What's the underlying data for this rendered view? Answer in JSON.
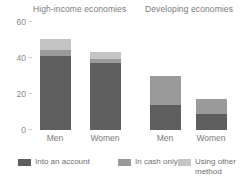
{
  "chart_data": {
    "type": "bar",
    "subtype": "stacked",
    "title": "",
    "xlabel": "",
    "ylabel": "",
    "ylim": [
      0,
      60
    ],
    "yticks": [
      0,
      20,
      40,
      60
    ],
    "grid": false,
    "legend_position": "bottom",
    "panels": [
      {
        "name": "High-income economies",
        "categories": [
          "Men",
          "Women"
        ]
      },
      {
        "name": "Developing economies",
        "categories": [
          "Men",
          "Women"
        ]
      }
    ],
    "categories": [
      "Men",
      "Women",
      "Men",
      "Women"
    ],
    "series": [
      {
        "name": "Into an account",
        "color": "#5e5e5e",
        "values": [
          41,
          37,
          14,
          9
        ]
      },
      {
        "name": "In cash only",
        "color": "#9a9a9a",
        "values": [
          3,
          2,
          16,
          8
        ]
      },
      {
        "name": "Using other method",
        "color": "#c4c4c4",
        "values": [
          6,
          4,
          0,
          0
        ]
      }
    ],
    "totals": [
      50,
      43,
      30,
      17
    ]
  },
  "titles": {
    "high_income": "High-income economies",
    "developing": "Developing economies"
  },
  "yaxis": {
    "ticks": [
      {
        "label": "60",
        "value": 60
      },
      {
        "label": "40",
        "value": 40
      },
      {
        "label": "20",
        "value": 20
      },
      {
        "label": "0",
        "value": 0
      }
    ]
  },
  "xaxis": {
    "ticks": [
      {
        "label": "Men"
      },
      {
        "label": "Women"
      },
      {
        "label": "Men"
      },
      {
        "label": "Women"
      }
    ]
  },
  "legend": {
    "items": [
      {
        "label": "Into an account",
        "color": "#5e5e5e"
      },
      {
        "label": "In cash only",
        "color": "#9a9a9a"
      },
      {
        "label": "Using other\nmethod",
        "color": "#c4c4c4"
      }
    ]
  }
}
